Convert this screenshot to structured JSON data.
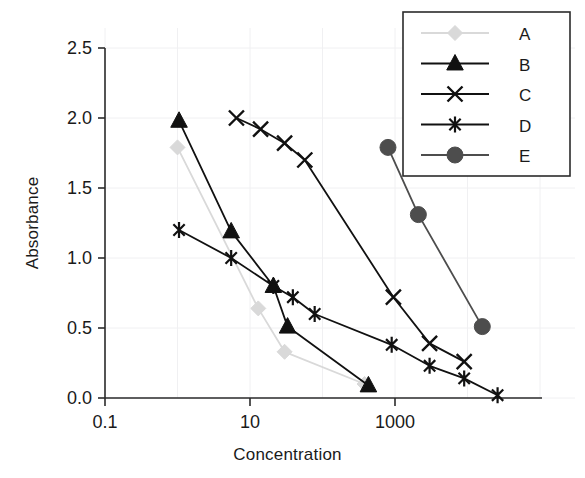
{
  "figure": {
    "width": 585,
    "height": 478,
    "background": "#ffffff"
  },
  "chart_data": {
    "type": "line",
    "title": "",
    "subtitle": "",
    "xlabel": "Concentration",
    "ylabel": "Absorbance",
    "xscale": "log",
    "yscale": "linear",
    "xlim": [
      0.1,
      100000
    ],
    "ylim": [
      0.0,
      2.5
    ],
    "xticks": [
      0.1,
      10,
      1000
    ],
    "xticklabels": [
      "0.1",
      "10",
      "1000"
    ],
    "yticks": [
      0.0,
      0.5,
      1.0,
      1.5,
      2.0,
      2.5
    ],
    "yticklabels": [
      "0.0",
      "0.5",
      "1.0",
      "1.5",
      "2.0",
      "2.5"
    ],
    "grid": true,
    "grid_color": "#f0f0f2",
    "legend_position": "top-right",
    "series": [
      {
        "name": "A",
        "color": "#d9d9d9",
        "marker": "diamond",
        "x": [
          1.0,
          13.0,
          30.0,
          380.0
        ],
        "y": [
          1.79,
          0.64,
          0.33,
          0.1
        ]
      },
      {
        "name": "B",
        "color": "#111111",
        "marker": "triangle",
        "x": [
          1.05,
          5.5,
          21.0,
          33.0,
          430.0
        ],
        "y": [
          1.98,
          1.19,
          0.8,
          0.51,
          0.09
        ]
      },
      {
        "name": "C",
        "color": "#111111",
        "marker": "x",
        "x": [
          6.5,
          14.0,
          30.0,
          57.0,
          950.0,
          3000.0,
          9000.0
        ],
        "y": [
          2.0,
          1.92,
          1.82,
          1.7,
          0.72,
          0.39,
          0.26
        ]
      },
      {
        "name": "D",
        "color": "#111111",
        "marker": "asterisk",
        "x": [
          1.05,
          5.5,
          21.0,
          39.0,
          78.0,
          900.0,
          3000.0,
          9000.0,
          26000.0
        ],
        "y": [
          1.2,
          1.0,
          0.8,
          0.72,
          0.6,
          0.38,
          0.23,
          0.14,
          0.02
        ]
      },
      {
        "name": "E",
        "color": "#4d4d4d",
        "marker": "circle",
        "x": [
          800.0,
          2100.0,
          16000.0
        ],
        "y": [
          1.79,
          1.31,
          0.51
        ]
      }
    ]
  },
  "legend": {
    "entries": [
      {
        "label": "A",
        "marker": "diamond",
        "color": "#d9d9d9"
      },
      {
        "label": "B",
        "marker": "triangle",
        "color": "#111111"
      },
      {
        "label": "C",
        "marker": "x",
        "color": "#111111"
      },
      {
        "label": "D",
        "marker": "asterisk",
        "color": "#111111"
      },
      {
        "label": "E",
        "marker": "circle",
        "color": "#4d4d4d"
      }
    ]
  }
}
